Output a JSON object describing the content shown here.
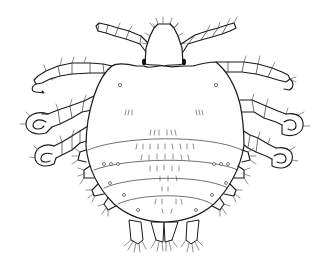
{
  "figure": {
    "subject": "arthropod line illustration (dorsal view)",
    "background_color": "#ffffff",
    "line_color": "#1a1a1a",
    "eye_color": "#111111",
    "parts": {
      "head": "head",
      "eyes": [
        "left-eye",
        "right-eye"
      ],
      "thorax": "thorax",
      "abdomen_segments": 4,
      "legs": [
        {
          "name": "left-front-leg",
          "type": "slender"
        },
        {
          "name": "right-front-leg",
          "type": "slender"
        },
        {
          "name": "left-second-leg",
          "type": "hooked-claw"
        },
        {
          "name": "right-second-leg",
          "type": "hooked-claw"
        },
        {
          "name": "left-third-leg",
          "type": "grasping-claw"
        },
        {
          "name": "right-third-leg",
          "type": "grasping-claw"
        },
        {
          "name": "left-fourth-leg",
          "type": "grasping-claw"
        },
        {
          "name": "right-fourth-leg",
          "type": "grasping-claw"
        }
      ],
      "posterior_lobes": 4,
      "lateral_tubercles_per_side": 4
    }
  }
}
